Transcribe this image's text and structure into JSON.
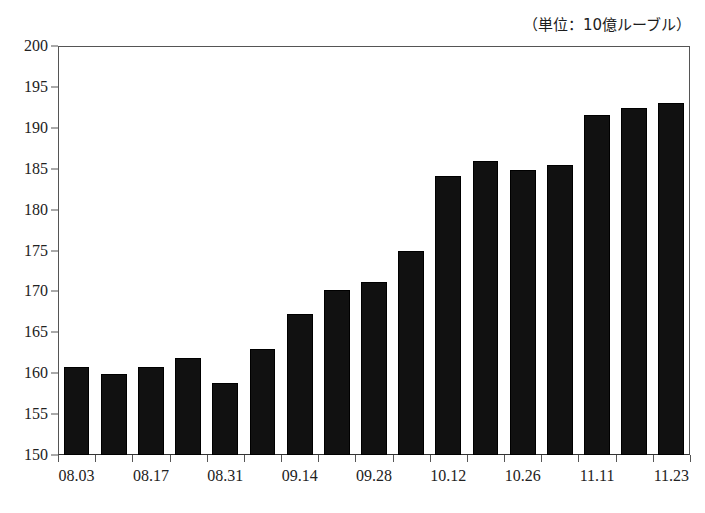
{
  "caption": {
    "unit_note": "（単位：10億ルーブル）"
  },
  "chart_data": {
    "type": "bar",
    "title": "",
    "subtitle": "",
    "xlabel": "",
    "ylabel": "",
    "unit_note": "（単位：10億ルーブル）",
    "ylim": [
      150,
      200
    ],
    "ytick_step": 5,
    "yticks": [
      200,
      195,
      190,
      185,
      180,
      175,
      170,
      165,
      160,
      155,
      150
    ],
    "ytick_labels": [
      "200",
      "195",
      "190",
      "185",
      "180",
      "175",
      "170",
      "165",
      "160",
      "155",
      "150"
    ],
    "grid": false,
    "legend": null,
    "bar_color": "#111111",
    "background_color": "#ffffff",
    "categories": [
      "08.03",
      "08.10",
      "08.17",
      "08.24",
      "08.31",
      "09.07",
      "09.14",
      "09.21",
      "09.28",
      "10.05",
      "10.12",
      "10.19",
      "10.26",
      "11.02",
      "11.11",
      "11.17",
      "11.23"
    ],
    "xtick_labels": [
      "08.03",
      "08.17",
      "08.31",
      "09.14",
      "09.28",
      "10.12",
      "10.26",
      "11.11",
      "11.23"
    ],
    "xtick_label_indices": [
      0,
      2,
      4,
      6,
      8,
      10,
      12,
      14,
      16
    ],
    "values": [
      160.7,
      159.9,
      160.7,
      161.8,
      158.8,
      162.9,
      167.3,
      170.2,
      171.2,
      175.0,
      184.1,
      186.0,
      184.8,
      185.4,
      191.6,
      192.4,
      193.0
    ],
    "n_bars": 17
  }
}
